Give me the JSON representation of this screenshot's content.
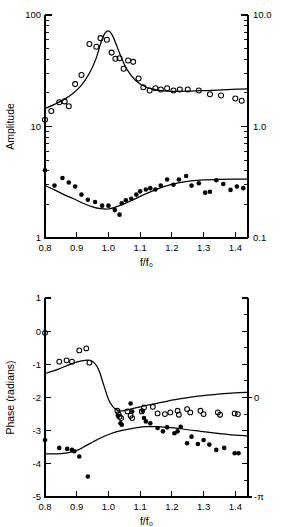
{
  "figure": {
    "title": "",
    "panels": [
      "amplitude-panel",
      "phase-panel"
    ]
  },
  "chart_data": [
    {
      "id": "amplitude",
      "type": "scatter",
      "title": "",
      "xlabel": "f/f₀",
      "ylabel": "Amplitude",
      "xlim": [
        0.8,
        1.44
      ],
      "ylim": [
        1,
        100
      ],
      "yscale": "log",
      "xscale": "linear",
      "grid": false,
      "legend": "none",
      "xticks": [
        0.8,
        0.9,
        1.0,
        1.1,
        1.2,
        1.3,
        1.4
      ],
      "xticklabels": [
        "0.8",
        "0.9",
        "1.0",
        "1.1",
        "1.2",
        "1.3",
        "1.4"
      ],
      "yticks_left": [
        1,
        10,
        100
      ],
      "yticklabels_left": [
        "1",
        "10",
        "100"
      ],
      "yticks_right": [
        0.1,
        1.0,
        10.0
      ],
      "yticklabels_right": [
        "0.1",
        "1.0",
        "10.0"
      ],
      "right_axis_note": "secondary log scale, decade-shifted by 0.01",
      "series": [
        {
          "name": "open-circles-upper",
          "marker": "open-circle",
          "x": [
            0.8,
            0.82,
            0.845,
            0.862,
            0.875,
            0.895,
            0.915,
            0.94,
            0.962,
            0.975,
            0.995,
            1.01,
            1.022,
            1.035,
            1.048,
            1.062,
            1.078,
            1.095,
            1.11,
            1.13,
            1.148,
            1.165,
            1.185,
            1.205,
            1.225,
            1.25,
            1.285,
            1.32,
            1.355,
            1.4,
            1.42
          ],
          "y": [
            11.5,
            13.8,
            16.5,
            16.8,
            15.2,
            24.0,
            29.0,
            55.0,
            52.0,
            62.0,
            60.0,
            46.0,
            40.5,
            41.0,
            33.0,
            39.0,
            38.0,
            27.0,
            22.5,
            21.0,
            22.0,
            21.5,
            22.0,
            21.0,
            21.5,
            21.5,
            21.0,
            19.5,
            19.0,
            17.8,
            17.0
          ]
        },
        {
          "name": "filled-circles-lower",
          "marker": "filled-circle",
          "x": [
            0.8,
            0.83,
            0.855,
            0.875,
            0.895,
            0.915,
            0.935,
            0.958,
            0.98,
            1.0,
            1.02,
            1.035,
            1.042,
            1.055,
            1.072,
            1.088,
            1.1,
            1.118,
            1.132,
            1.148,
            1.165,
            1.185,
            1.205,
            1.222,
            1.245,
            1.262,
            1.285,
            1.305,
            1.32,
            1.34,
            1.362,
            1.385,
            1.405,
            1.425
          ],
          "y": [
            4.05,
            2.95,
            3.45,
            3.15,
            2.9,
            2.45,
            2.2,
            2.1,
            1.95,
            1.95,
            1.78,
            1.62,
            2.05,
            2.18,
            2.25,
            2.45,
            2.62,
            2.72,
            2.8,
            2.72,
            2.95,
            3.35,
            3.0,
            3.35,
            3.6,
            2.95,
            3.1,
            2.55,
            2.6,
            3.3,
            3.05,
            2.7,
            2.9,
            2.8
          ]
        }
      ],
      "fits": [
        {
          "name": "resonance-fit-upper",
          "description": "Lorentzian resonance peaking near f/f0 = 1.0 at amplitude ~72, tailing to ~21",
          "x": [
            0.8,
            0.83,
            0.86,
            0.89,
            0.915,
            0.94,
            0.96,
            0.975,
            0.988,
            1.0,
            1.012,
            1.025,
            1.04,
            1.06,
            1.085,
            1.11,
            1.14,
            1.175,
            1.215,
            1.26,
            1.31,
            1.36,
            1.405,
            1.44
          ],
          "y": [
            14.5,
            15.8,
            17.5,
            20.0,
            23.5,
            30.0,
            40.0,
            55.0,
            68.0,
            72.0,
            66.0,
            54.0,
            42.0,
            32.0,
            26.0,
            23.2,
            21.6,
            20.9,
            20.7,
            20.8,
            21.0,
            21.3,
            21.6,
            21.8
          ]
        },
        {
          "name": "broad-fit-lower",
          "description": "Broad shallow minimum near f/f0 = 0.98, rising to plateau ~3.3",
          "x": [
            0.8,
            0.83,
            0.86,
            0.89,
            0.92,
            0.95,
            0.975,
            1.0,
            1.02,
            1.045,
            1.075,
            1.105,
            1.14,
            1.18,
            1.22,
            1.26,
            1.3,
            1.345,
            1.395,
            1.44
          ],
          "y": [
            2.95,
            2.7,
            2.45,
            2.25,
            2.05,
            1.9,
            1.83,
            1.82,
            1.88,
            2.0,
            2.18,
            2.4,
            2.65,
            2.92,
            3.12,
            3.25,
            3.32,
            3.36,
            3.38,
            3.38
          ]
        }
      ]
    },
    {
      "id": "phase",
      "type": "scatter",
      "title": "",
      "xlabel": "f/f₀",
      "ylabel": "Phase (radians)",
      "xlim": [
        0.8,
        1.44
      ],
      "ylim": [
        -5,
        1
      ],
      "yscale": "linear",
      "xscale": "linear",
      "grid": false,
      "legend": "none",
      "xticks": [
        0.8,
        0.9,
        1.0,
        1.1,
        1.2,
        1.3,
        1.4
      ],
      "xticklabels": [
        "0.8",
        "0.9",
        "1.0",
        "1.1",
        "1.2",
        "1.3",
        "1.4"
      ],
      "yticks_left": [
        1,
        0,
        -1,
        -2,
        -3,
        -4,
        -5
      ],
      "yticklabels_left": [
        "1",
        "0",
        "-1",
        "-2",
        "-3",
        "-4",
        "-5"
      ],
      "yticks_right": [
        -2,
        -5
      ],
      "yticklabels_right": [
        "0",
        "-π"
      ],
      "right_axis_note": "offset axis: 0 aligned at -2 rad, -pi aligned at -5 rad",
      "series": [
        {
          "name": "open-circles-upper",
          "marker": "open-circle",
          "x": [
            0.8,
            0.845,
            0.868,
            0.885,
            0.908,
            0.93,
            0.94,
            1.028,
            1.032,
            1.035,
            1.04,
            1.06,
            1.07,
            1.075,
            1.105,
            1.112,
            1.14,
            1.155,
            1.178,
            1.195,
            1.218,
            1.222,
            1.248,
            1.258,
            1.29,
            1.3,
            1.345,
            1.352,
            1.398,
            1.408
          ],
          "y": [
            -0.05,
            -0.92,
            -0.88,
            -0.92,
            -0.58,
            -0.52,
            -0.95,
            -2.4,
            -2.5,
            -2.58,
            -2.62,
            -2.42,
            -2.55,
            -2.62,
            -2.42,
            -2.3,
            -2.28,
            -2.48,
            -2.5,
            -2.45,
            -2.4,
            -2.52,
            -2.35,
            -2.45,
            -2.4,
            -2.5,
            -2.45,
            -2.52,
            -2.48,
            -2.5
          ]
        },
        {
          "name": "filled-circles-lower",
          "marker": "filled-circle",
          "x": [
            0.8,
            0.845,
            0.87,
            0.885,
            0.892,
            0.908,
            0.935,
            1.03,
            1.038,
            1.042,
            1.07,
            1.075,
            1.108,
            1.112,
            1.118,
            1.132,
            1.155,
            1.172,
            1.185,
            1.208,
            1.218,
            1.228,
            1.248,
            1.262,
            1.282,
            1.3,
            1.318,
            1.34,
            1.365,
            1.398,
            1.41
          ],
          "y": [
            -3.28,
            -3.52,
            -3.55,
            -3.58,
            -3.62,
            -3.78,
            -4.38,
            -2.55,
            -2.78,
            -2.82,
            -2.18,
            -2.42,
            -2.4,
            -2.62,
            -2.72,
            -2.78,
            -2.92,
            -3.02,
            -2.9,
            -3.08,
            -3.02,
            -2.88,
            -3.38,
            -3.18,
            -3.4,
            -3.28,
            -3.42,
            -3.58,
            -3.52,
            -3.68,
            -3.68
          ]
        }
      ],
      "fits": [
        {
          "name": "sigmoid-fit-upper",
          "description": "Flat near -1.1, sharp drop through f/f0 = 1.0 to about -2.4, then slow rise to -1.85",
          "x": [
            0.8,
            0.84,
            0.88,
            0.905,
            0.925,
            0.94,
            0.955,
            0.97,
            0.985,
            1.0,
            1.012,
            1.022,
            1.032,
            1.045,
            1.07,
            1.1,
            1.14,
            1.19,
            1.24,
            1.29,
            1.345,
            1.4,
            1.44
          ],
          "y": [
            -1.28,
            -1.15,
            -1.0,
            -0.92,
            -0.88,
            -0.88,
            -0.95,
            -1.18,
            -1.62,
            -2.05,
            -2.25,
            -2.35,
            -2.4,
            -2.4,
            -2.35,
            -2.28,
            -2.2,
            -2.1,
            -2.02,
            -1.95,
            -1.9,
            -1.86,
            -1.84
          ]
        },
        {
          "name": "lower-branch-fit",
          "description": "Rises from -3.7 near 0.8 to a broad maximum near -2.88 at f/f0 = 1.14, then falls to -3.15",
          "x": [
            0.8,
            0.84,
            0.875,
            0.905,
            0.93,
            0.955,
            0.98,
            1.005,
            1.03,
            1.06,
            1.09,
            1.12,
            1.15,
            1.185,
            1.22,
            1.255,
            1.29,
            1.33,
            1.38,
            1.44
          ],
          "y": [
            -3.7,
            -3.7,
            -3.66,
            -3.58,
            -3.45,
            -3.32,
            -3.2,
            -3.1,
            -3.02,
            -2.96,
            -2.91,
            -2.88,
            -2.88,
            -2.9,
            -2.93,
            -2.98,
            -3.02,
            -3.07,
            -3.12,
            -3.16
          ]
        }
      ]
    }
  ]
}
